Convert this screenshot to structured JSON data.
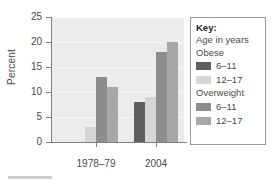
{
  "chart_data": {
    "type": "bar",
    "title": "",
    "xlabel": "",
    "ylabel": "Percent",
    "ylim": [
      0,
      25
    ],
    "yticks": [
      0,
      5,
      10,
      15,
      20,
      25
    ],
    "ytick_labels": [
      "0",
      "5",
      "10",
      "15",
      "20",
      "25"
    ],
    "categories": [
      "1978–79",
      "2004"
    ],
    "grid": true,
    "legend_position": "right-outside",
    "series": [
      {
        "name": "Obese 6–11",
        "color": "#5e5e5e",
        "values": [
          0,
          8
        ]
      },
      {
        "name": "Obese 12–17",
        "color": "#d5d5d5",
        "values": [
          3,
          9
        ]
      },
      {
        "name": "Overweight 6–11",
        "color": "#8d8d8d",
        "values": [
          13,
          18
        ]
      },
      {
        "name": "Overweight 12–17",
        "color": "#a8a8a8",
        "values": [
          11,
          20
        ]
      }
    ]
  },
  "axis": {
    "y_title": "Percent",
    "y_tick_labels": [
      "25",
      "20",
      "15",
      "10",
      "5",
      "0"
    ],
    "x_tick_labels": [
      "1978–79",
      "2004"
    ]
  },
  "legend": {
    "title": "Key:",
    "subtitle": "Age in years",
    "group_obese_label": "Obese",
    "group_overweight_label": "Overweight",
    "entries": [
      {
        "label": "6–11",
        "color": "#5e5e5e"
      },
      {
        "label": "12–17",
        "color": "#d5d5d5"
      },
      {
        "label": "6–11",
        "color": "#8d8d8d"
      },
      {
        "label": "12–17",
        "color": "#a8a8a8"
      }
    ]
  },
  "colors": {
    "plot_background": "#ececed",
    "axis": "#7d7d7d",
    "gridline": "#f7f7f7",
    "text": "#4a4a4a",
    "legend_border": "#9a9a9a",
    "page_background": "#ffffff"
  }
}
